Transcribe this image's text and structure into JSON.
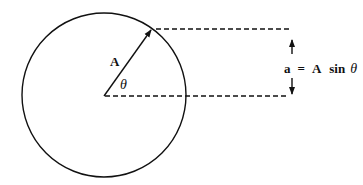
{
  "diagram": {
    "colors": {
      "stroke": "#111111",
      "background": "#ffffff"
    },
    "circle": {
      "cx": 104,
      "cy": 95,
      "r": 82
    },
    "vector": {
      "label": "A",
      "from": [
        104,
        96
      ],
      "to": [
        152,
        29
      ]
    },
    "angle": {
      "label": "θ"
    },
    "projection": {
      "top_line": {
        "x1": 156,
        "x2": 289,
        "y": 29
      },
      "bottom_line": {
        "x1": 105,
        "x2": 289,
        "y": 96
      },
      "dimension_x": 292
    },
    "equation": {
      "lhs": "a",
      "equals": "=",
      "rhs_coeff": "A",
      "rhs_func": "sin",
      "rhs_var": "θ"
    }
  }
}
